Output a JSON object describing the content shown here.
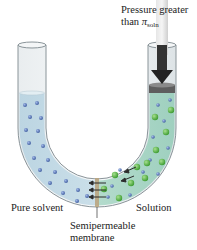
{
  "figure": {
    "labels": {
      "pressure_line1": "Pressure greater",
      "pressure_line2_prefix": "than ",
      "pressure_symbol": "π",
      "pressure_subscript": "soln",
      "left_side": "Pure solvent",
      "right_side": "Solution",
      "membrane_line1": "Semipermeable",
      "membrane_line2": "membrane"
    },
    "colors": {
      "solvent_liquid": "#cfe3ec",
      "solution_liquid": "#cde9df",
      "solvent_particle": "#5b79b8",
      "solute_particle": "#5bb34a",
      "membrane": "#b9a27a",
      "piston": "#5a5a5a",
      "arrow": "#2b2b2b",
      "pressure_arrow": "#d8d8d8"
    }
  }
}
